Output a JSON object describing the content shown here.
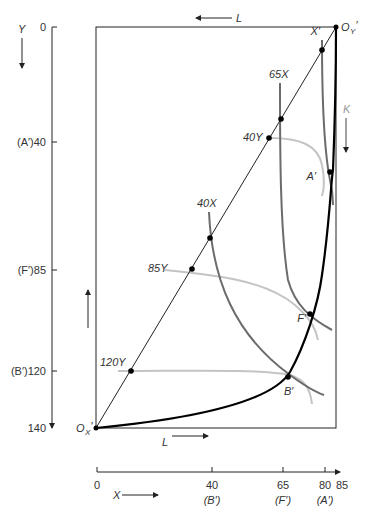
{
  "diagram": {
    "type": "edgeworth-box",
    "left_axis": {
      "variable": "Y",
      "ticks": [
        {
          "value": 0,
          "label": "0"
        },
        {
          "value": 40,
          "label": "(A′)40"
        },
        {
          "value": 85,
          "label": "(F′)85"
        },
        {
          "value": 120,
          "label": "(B′)120"
        },
        {
          "value": 140,
          "label": "140"
        }
      ]
    },
    "bottom_axis": {
      "variable": "X",
      "ticks": [
        {
          "value": 0,
          "label": "0",
          "sublabel": ""
        },
        {
          "value": 40,
          "label": "40",
          "sublabel": "(B′)"
        },
        {
          "value": 65,
          "label": "65",
          "sublabel": "(F′)"
        },
        {
          "value": 80,
          "label": "80",
          "sublabel": "(A′)"
        },
        {
          "value": 85,
          "label": "85",
          "sublabel": ""
        }
      ]
    },
    "origins": {
      "ox": {
        "main": "O",
        "sub": "X",
        "prime": "′"
      },
      "oy": {
        "main": "O",
        "sub": "Y",
        "prime": "′"
      }
    },
    "box_labels": {
      "top_L": "L",
      "bottom_L": "L",
      "right_K": "K",
      "diag_X": "X′"
    },
    "isoquants_x": [
      {
        "label": "40X"
      },
      {
        "label": "65X"
      }
    ],
    "isoquants_y": [
      {
        "label": "40Y"
      },
      {
        "label": "85Y"
      },
      {
        "label": "120Y"
      }
    ],
    "points": [
      {
        "label": "A′"
      },
      {
        "label": "F′"
      },
      {
        "label": "B′"
      }
    ],
    "colors": {
      "axis": "#222222",
      "contract_curve": "#000000",
      "x_isoquant": "#6b6b6b",
      "y_isoquant": "#c4c4c4"
    }
  }
}
